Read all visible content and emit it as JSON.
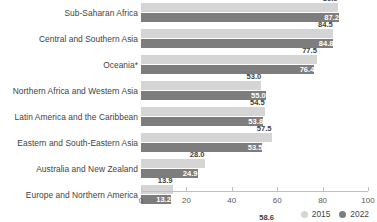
{
  "chart_data": {
    "type": "bar",
    "orientation": "horizontal",
    "title": "",
    "subtitle": "",
    "xlabel": "",
    "ylabel": "",
    "xlim": [
      0,
      100
    ],
    "xticks": [
      "0",
      "20",
      "40",
      "60",
      "80",
      "100"
    ],
    "grid": false,
    "legend_position": "bottom-right",
    "categories": [
      "Sub-Saharan Africa",
      "Central and Southern Asia",
      "Oceania*",
      "Northern Africa and Western Asia",
      "Latin America and the Caribbean",
      "Eastern and South-Eastern Asia",
      "Australia and New Zealand",
      "Europe and Northern America",
      "World"
    ],
    "series": [
      {
        "name": "2015",
        "color": "#d5d5d5",
        "values": [
          86.6,
          84.5,
          77.5,
          53.0,
          54.5,
          57.5,
          28.0,
          13.9,
          58.6
        ],
        "labels": [
          "86.6",
          "84.5",
          "77.5",
          "53.0",
          "54.5",
          "57.5",
          "28.0",
          "13.9",
          "58.6"
        ]
      },
      {
        "name": "2022",
        "color": "#7d7d7d",
        "values": [
          87.2,
          84.8,
          76.4,
          55.0,
          53.8,
          53.5,
          24.9,
          13.2,
          58.0
        ],
        "labels": [
          "87.2",
          "84.8",
          "76.4",
          "55.0",
          "53.8",
          "53.5",
          "24.9",
          "13.2",
          "58.0"
        ]
      }
    ],
    "annotations": [
      "*"
    ]
  },
  "legend": {
    "items": [
      {
        "label": "2015",
        "color": "#d5d5d5"
      },
      {
        "label": "2022",
        "color": "#7d7d7d"
      }
    ]
  },
  "colors": {
    "series_2015": "#d5d5d5",
    "series_2022": "#7d7d7d",
    "axis": "#bfbfbf",
    "text": "#3f3f3f",
    "label_on_dark": "#ffffff"
  }
}
